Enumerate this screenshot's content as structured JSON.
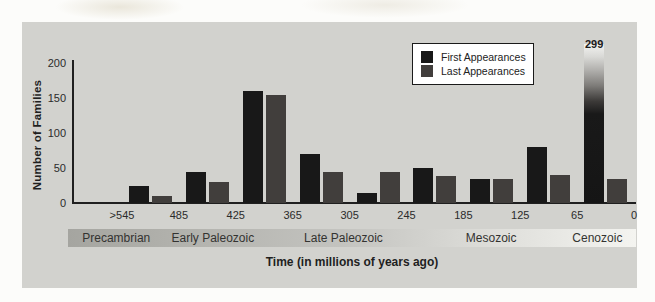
{
  "figure": {
    "legend": {
      "items": [
        {
          "label": "First Appearances",
          "color": "#181818"
        },
        {
          "label": "Last Appearances",
          "color": "#413e3c"
        }
      ]
    }
  },
  "chart_data": {
    "type": "bar",
    "title": "",
    "xlabel": "Time (in millions of years ago)",
    "ylabel": "Number of Families",
    "ylim": [
      0,
      200
    ],
    "y_ticks": [
      0,
      50,
      100,
      150,
      200
    ],
    "x_tick_labels": [
      ">545",
      "485",
      "425",
      "365",
      "305",
      "245",
      "185",
      "125",
      "65",
      "0"
    ],
    "bars_span_intervals_between_ticks": true,
    "grid": false,
    "legend_position": "top-right",
    "series": [
      {
        "name": "First Appearances",
        "color": "#181818",
        "values": [
          25,
          45,
          160,
          70,
          15,
          50,
          35,
          80,
          299
        ]
      },
      {
        "name": "Last Appearances",
        "color": "#413e3c",
        "values": [
          10,
          30,
          155,
          45,
          45,
          38,
          35,
          40,
          35
        ]
      }
    ],
    "truncated_bar": {
      "series": "First Appearances",
      "interval_index": 8,
      "value": 299,
      "display_label": "299",
      "note": "bar exceeds y-axis maximum; drawn with fade-to-light gradient at top"
    },
    "eras": [
      {
        "label": "Precambrian",
        "center_pct": 8.5
      },
      {
        "label": "Early Paleozoic",
        "center_pct": 25.5
      },
      {
        "label": "Late Paleozoic",
        "center_pct": 48.5
      },
      {
        "label": "Mesozoic",
        "center_pct": 74.5
      },
      {
        "label": "Cenozoic",
        "center_pct": 93.2
      }
    ]
  }
}
